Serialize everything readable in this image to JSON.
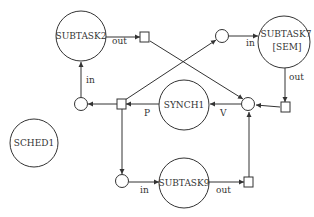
{
  "diagram": {
    "type": "petri-net",
    "nodes": {
      "subtask2": {
        "label": "SUBTASK2"
      },
      "subtask7": {
        "label": "SUBTASK7",
        "sublabel": "[SEM]"
      },
      "synch1": {
        "label": "SYNCH1"
      },
      "sched1": {
        "label": "SCHED1"
      },
      "subtask9": {
        "label": "SUBTASK9"
      }
    },
    "edge_labels": {
      "subtask2_out": "out",
      "subtask2_in": "in",
      "subtask7_in": "in",
      "subtask7_out": "out",
      "synch1_p": "P",
      "synch1_v": "V",
      "subtask9_in": "in",
      "subtask9_out": "out"
    },
    "colors": {
      "stroke": "#333333",
      "background": "#ffffff"
    }
  }
}
